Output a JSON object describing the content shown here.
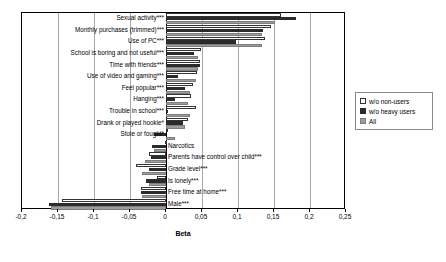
{
  "chart_data": {
    "type": "bar",
    "orientation": "horizontal",
    "title": "",
    "xlabel": "Beta",
    "ylabel": "",
    "xlim": [
      -0.2,
      0.25
    ],
    "xticks": [
      -0.2,
      -0.15,
      -0.1,
      -0.05,
      0,
      0.05,
      0.1,
      0.15,
      0.2,
      0.25
    ],
    "xticklabels": [
      "-0,2",
      "-0,15",
      "-0,1",
      "-0,05",
      "0",
      "0,05",
      "0,1",
      "0,15",
      "0,2",
      "0,25"
    ],
    "grid": true,
    "grid_axis": "x",
    "legend_position": "right",
    "categories": [
      "Sexual activity***",
      "Monthly purchases (trimmed)***",
      "Use of PC***",
      "School is boring and not useful***",
      "Time with friends***",
      "Use of video and gaming***",
      "Feel popular***",
      "Hanging***",
      "Trouble in school***",
      "Drank or played hookie*",
      "Stole or fought*",
      "Narcotics",
      "Parents have control over child***",
      "Grade level***",
      "Is lonely***",
      "Free time at home***",
      "Male***"
    ],
    "series": [
      {
        "name": "w/o non-users",
        "color": "#ffffff",
        "values": [
          0.16,
          0.146,
          0.138,
          0.048,
          0.047,
          0.043,
          0.038,
          0.035,
          0.041,
          0.03,
          0.0,
          -0.002,
          -0.023,
          -0.041,
          -0.013,
          -0.035,
          -0.144
        ]
      },
      {
        "name": "w/o heavy users",
        "color": "#2b2b2b",
        "values": [
          0.181,
          0.135,
          0.097,
          0.039,
          0.047,
          0.016,
          0.026,
          0.013,
          0.003,
          0.024,
          -0.016,
          -0.019,
          -0.021,
          -0.024,
          -0.028,
          -0.035,
          -0.163
        ]
      },
      {
        "name": "All",
        "color": "#9d9d9d",
        "values": [
          0.151,
          0.133,
          0.133,
          0.045,
          0.045,
          0.041,
          0.033,
          0.031,
          0.034,
          0.026,
          0.012,
          -0.016,
          -0.029,
          -0.033,
          -0.023,
          -0.033,
          -0.16
        ]
      }
    ]
  },
  "axis": {
    "x_title": "Beta"
  },
  "legend": {
    "items": [
      {
        "label": "w/o non-users",
        "swatch": "white-square-swatch"
      },
      {
        "label": "w/o heavy users",
        "swatch": "black-square-swatch"
      },
      {
        "label": "All",
        "swatch": "gray-square-swatch"
      }
    ]
  }
}
